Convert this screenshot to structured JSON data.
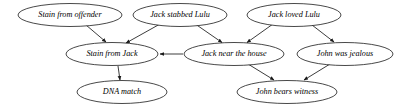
{
  "diagram": {
    "type": "directed-acyclic-graph",
    "title": "",
    "background_color": "#ffffff",
    "node_stroke_color": "#1a1a1a",
    "edge_color": "#1a1a1a",
    "text_color": "#000000",
    "nodes": [
      {
        "id": "stain_offender",
        "label": "Stain from offender",
        "cx": 70,
        "cy": 15,
        "rx": 52,
        "ry": 11.5
      },
      {
        "id": "jack_stabbed",
        "label": "Jack stabbed Lulu",
        "cx": 180,
        "cy": 15,
        "rx": 47,
        "ry": 11.5
      },
      {
        "id": "jack_loved",
        "label": "Jack loved Lulu",
        "cx": 294,
        "cy": 15,
        "rx": 47,
        "ry": 11.5
      },
      {
        "id": "stain_jack",
        "label": "Stain from Jack",
        "cx": 112,
        "cy": 54,
        "rx": 46,
        "ry": 11.5
      },
      {
        "id": "jack_near",
        "label": "Jack near the house",
        "cx": 234,
        "cy": 54,
        "rx": 50,
        "ry": 11.5
      },
      {
        "id": "john_jealous",
        "label": "John was jealous",
        "cx": 345,
        "cy": 54,
        "rx": 48,
        "ry": 11.5
      },
      {
        "id": "dna_match",
        "label": "DNA match",
        "cx": 122,
        "cy": 92,
        "rx": 45,
        "ry": 11.5
      },
      {
        "id": "john_witness",
        "label": "John bears witness",
        "cx": 287,
        "cy": 92,
        "rx": 50,
        "ry": 11.5
      }
    ],
    "edges": [
      {
        "id": "e1",
        "from": "stain_offender",
        "to": "stain_jack",
        "x1": 86,
        "y1": 25,
        "x2": 106,
        "y2": 42
      },
      {
        "id": "e2",
        "from": "jack_stabbed",
        "to": "stain_jack",
        "x1": 160,
        "y1": 24,
        "x2": 126,
        "y2": 43
      },
      {
        "id": "e3",
        "from": "jack_stabbed",
        "to": "jack_near",
        "x1": 196,
        "y1": 24.5,
        "x2": 222,
        "y2": 42.5
      },
      {
        "id": "e4",
        "from": "jack_loved",
        "to": "jack_near",
        "x1": 273,
        "y1": 24,
        "x2": 247,
        "y2": 42.5
      },
      {
        "id": "e5",
        "from": "jack_loved",
        "to": "john_jealous",
        "x1": 312,
        "y1": 25,
        "x2": 334,
        "y2": 42
      },
      {
        "id": "e6",
        "from": "jack_near",
        "to": "stain_jack",
        "x1": 183,
        "y1": 54,
        "x2": 160,
        "y2": 54
      },
      {
        "id": "e7",
        "from": "stain_jack",
        "to": "dna_match",
        "x1": 118,
        "y1": 66,
        "x2": 120,
        "y2": 80
      },
      {
        "id": "e8",
        "from": "jack_near",
        "to": "john_witness",
        "x1": 248,
        "y1": 64,
        "x2": 274,
        "y2": 80
      },
      {
        "id": "e9",
        "from": "john_jealous",
        "to": "john_witness",
        "x1": 330,
        "y1": 64,
        "x2": 304,
        "y2": 80
      }
    ]
  }
}
